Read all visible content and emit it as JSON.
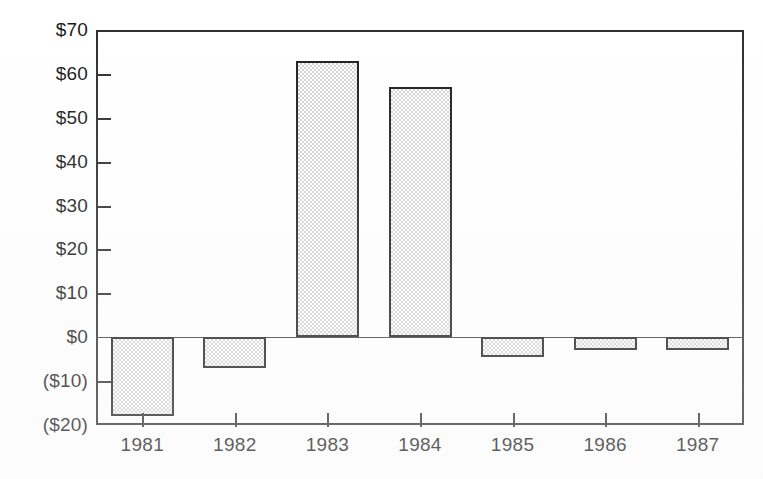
{
  "chart_data": {
    "type": "bar",
    "title": "",
    "subtitle": "",
    "xlabel": "",
    "ylabel": "",
    "categories": [
      "1981",
      "1982",
      "1983",
      "1984",
      "1985",
      "1986",
      "1987"
    ],
    "values": [
      -18,
      -7,
      63,
      57,
      -4.5,
      -3,
      -3
    ],
    "series": [
      {
        "name": "",
        "values": [
          -18,
          -7,
          63,
          57,
          -4.5,
          -3,
          -3
        ]
      }
    ],
    "ylim": [
      -20,
      70
    ],
    "ytick_values": [
      70,
      60,
      50,
      40,
      30,
      20,
      10,
      0,
      -10,
      -20
    ],
    "ytick_labels": [
      "$70",
      "$60",
      "$50",
      "$40",
      "$30",
      "$20",
      "$10",
      "$0",
      "($10)",
      "($20)"
    ],
    "xtick_labels": [
      "1981",
      "1982",
      "1983",
      "1984",
      "1985",
      "1986",
      "1987"
    ],
    "grid": false,
    "legend": false,
    "legend_position": "none",
    "annotations": [],
    "colors": {
      "bar_fill": "#d2d2d2",
      "bar_edge": "#1c1c1c",
      "axis": "#2b2b2b",
      "text": "#151515",
      "background": "#ffffff"
    }
  },
  "axis": {
    "y_labels": [
      "$70",
      "$60",
      "$50",
      "$40",
      "$30",
      "$20",
      "$10",
      "$0",
      "($10)",
      "($20)"
    ],
    "x_labels": [
      "1981",
      "1982",
      "1983",
      "1984",
      "1985",
      "1986",
      "1987"
    ]
  }
}
